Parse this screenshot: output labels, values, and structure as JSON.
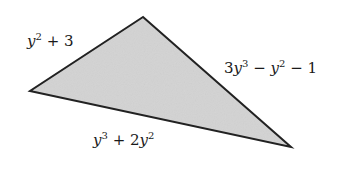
{
  "diagram": {
    "type": "triangle",
    "fill_color": "#d3d3d3",
    "stroke_color": "#222222",
    "vertices": [
      {
        "name": "top",
        "x": 143,
        "y": 17
      },
      {
        "name": "left",
        "x": 30,
        "y": 91
      },
      {
        "name": "right",
        "x": 291,
        "y": 147
      }
    ],
    "sides": [
      {
        "id": "left-side",
        "between": [
          "left",
          "top"
        ],
        "expression": "y^2 + 3"
      },
      {
        "id": "right-side",
        "between": [
          "top",
          "right"
        ],
        "expression": "3y^3 - y^2 - 1"
      },
      {
        "id": "bottom-side",
        "between": [
          "left",
          "right"
        ],
        "expression": "y^3 + 2y^2"
      }
    ],
    "labels": {
      "left": {
        "var": "y",
        "exp": "2",
        "rest": " + 3"
      },
      "right": {
        "coef": "3",
        "var1": "y",
        "exp1": "3",
        "mid": " − ",
        "var2": "y",
        "exp2": "2",
        "rest": " − 1"
      },
      "bottom": {
        "var1": "y",
        "exp1": "3",
        "mid": " + 2",
        "var2": "y",
        "exp2": "2"
      }
    }
  }
}
